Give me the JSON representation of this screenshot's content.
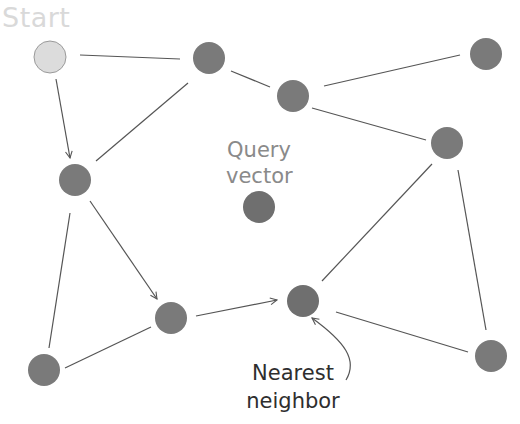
{
  "labels": {
    "start": "Start",
    "query_line1": "Query",
    "query_line2": "vector",
    "nearest_line1": "Nearest",
    "nearest_line2": "neighbor"
  },
  "colors": {
    "start_node": "#dcdcdc",
    "node": "#7a7a7a",
    "edge": "#555555",
    "start_text": "#d9d9d9",
    "query_text": "#8a8a8a",
    "nearest_text": "#2e2e2e"
  },
  "nodes": [
    {
      "id": "start",
      "x": 50,
      "y": 57
    },
    {
      "id": "n1",
      "x": 209,
      "y": 58
    },
    {
      "id": "n2",
      "x": 293,
      "y": 96
    },
    {
      "id": "n3",
      "x": 486,
      "y": 54
    },
    {
      "id": "n4",
      "x": 447,
      "y": 143
    },
    {
      "id": "n5",
      "x": 75,
      "y": 180
    },
    {
      "id": "query",
      "x": 259,
      "y": 207
    },
    {
      "id": "n6",
      "x": 171,
      "y": 318
    },
    {
      "id": "nearest",
      "x": 303,
      "y": 301
    },
    {
      "id": "n7",
      "x": 44,
      "y": 370
    },
    {
      "id": "n8",
      "x": 491,
      "y": 356
    }
  ],
  "edges": [
    {
      "from": "start",
      "to": "n1",
      "directed": false
    },
    {
      "from": "start",
      "to": "n5",
      "directed": true
    },
    {
      "from": "n1",
      "to": "n2",
      "directed": false
    },
    {
      "from": "n1",
      "to": "n5",
      "directed": false
    },
    {
      "from": "n2",
      "to": "n3",
      "directed": false
    },
    {
      "from": "n2",
      "to": "n4",
      "directed": false
    },
    {
      "from": "n4",
      "to": "nearest",
      "directed": false
    },
    {
      "from": "n4",
      "to": "n8",
      "directed": false
    },
    {
      "from": "n5",
      "to": "n6",
      "directed": true
    },
    {
      "from": "n5",
      "to": "n7",
      "directed": false
    },
    {
      "from": "n6",
      "to": "n7",
      "directed": false
    },
    {
      "from": "n6",
      "to": "nearest",
      "directed": true
    },
    {
      "from": "nearest",
      "to": "n8",
      "directed": false
    }
  ]
}
